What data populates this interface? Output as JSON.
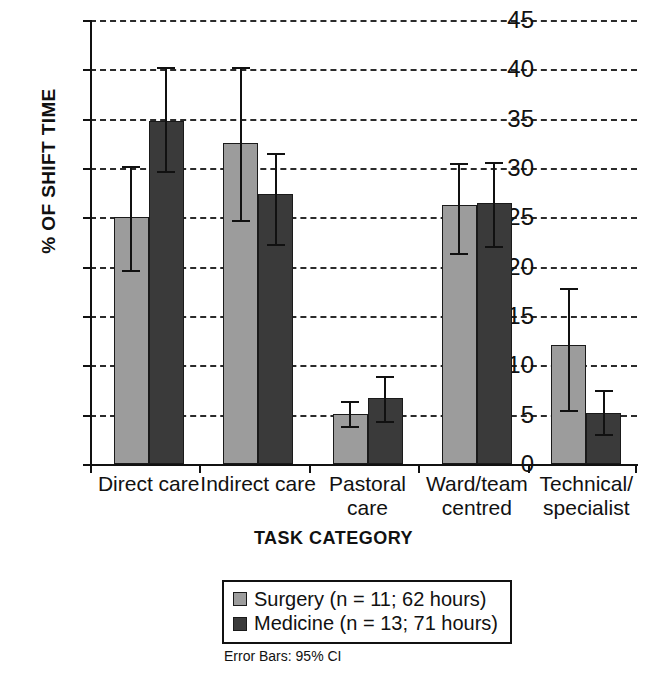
{
  "chart_data": {
    "type": "bar",
    "title": "",
    "xlabel": "TASK CATEGORY",
    "ylabel": "% OF SHIFT TIME",
    "ylim": [
      0,
      45
    ],
    "yticks": [
      0,
      5,
      10,
      15,
      20,
      25,
      30,
      35,
      40,
      45
    ],
    "grid": true,
    "legend_position": "bottom",
    "error_bars_note": "Error Bars: 95% CI",
    "categories": [
      "Direct care",
      "Indirect care",
      "Pastoral\ncare",
      "Ward/team\ncentred",
      "Technical/\nspecialist"
    ],
    "series": [
      {
        "name": "Surgery (n = 11; 62 hours)",
        "short_name": "Surgery",
        "color": "#9c9c9c",
        "values": [
          25.0,
          32.5,
          5.1,
          26.2,
          12.1
        ],
        "ci_low": [
          19.7,
          24.7,
          3.9,
          21.4,
          5.5
        ],
        "ci_high": [
          30.2,
          40.2,
          6.4,
          30.5,
          17.8
        ]
      },
      {
        "name": "Medicine (n = 13; 71 hours)",
        "short_name": "Medicine",
        "color": "#3a3a3a",
        "values": [
          34.8,
          27.4,
          6.7,
          26.5,
          5.2
        ],
        "ci_low": [
          29.7,
          22.3,
          4.4,
          22.1,
          3.0
        ],
        "ci_high": [
          40.2,
          31.5,
          8.9,
          30.6,
          7.5
        ]
      }
    ]
  },
  "legend": {
    "items": [
      {
        "label": "Surgery (n = 11; 62 hours)"
      },
      {
        "label": "Medicine (n = 13; 71 hours)"
      }
    ],
    "note": "Error Bars: 95% CI"
  },
  "axes": {
    "y_title": "% OF SHIFT TIME",
    "x_title": "TASK CATEGORY",
    "y_tick_labels": [
      "45",
      "40",
      "35",
      "30",
      "25",
      "20",
      "15",
      "10",
      "5",
      "0"
    ]
  }
}
